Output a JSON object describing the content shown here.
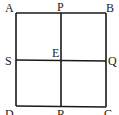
{
  "diagram": {
    "type": "square divided into four equal squares",
    "stroke_color": "#1a1a1a",
    "background": "#ffffff",
    "points": {
      "A": {
        "label": "A",
        "x": 16,
        "y": 13
      },
      "P": {
        "label": "P",
        "x": 61,
        "y": 13
      },
      "B": {
        "label": "B",
        "x": 106,
        "y": 13
      },
      "S": {
        "label": "S",
        "x": 16,
        "y": 60
      },
      "E": {
        "label": "E",
        "x": 61,
        "y": 60
      },
      "Q": {
        "label": "Q",
        "x": 106,
        "y": 61
      },
      "D": {
        "label": "D",
        "x": 16,
        "y": 106
      },
      "R": {
        "label": "R",
        "x": 61,
        "y": 106
      },
      "C": {
        "label": "C",
        "x": 106,
        "y": 107
      }
    },
    "segments": [
      "AB",
      "BC",
      "CD",
      "DA",
      "PR",
      "SQ"
    ]
  }
}
